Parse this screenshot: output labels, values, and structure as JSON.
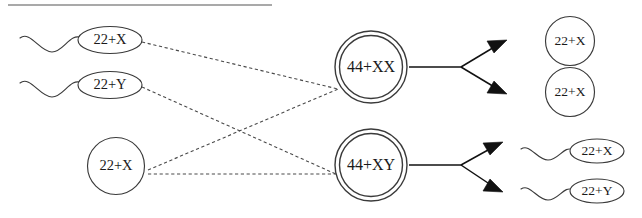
{
  "figure": {
    "title_rule": "horizontal-divider",
    "background_color": "#ffffff",
    "ink_color": "#3a3a3a",
    "width": 642,
    "height": 218
  },
  "gametes": {
    "sperm": [
      {
        "id": "sperm-1",
        "label": "22+X",
        "shape": "ellipse-with-flagellum"
      },
      {
        "id": "sperm-2",
        "label": "22+Y",
        "shape": "ellipse-with-flagellum"
      }
    ],
    "egg": [
      {
        "id": "egg-1",
        "label": "22+X",
        "shape": "circle"
      }
    ]
  },
  "zygotes": [
    {
      "id": "zygote-xx",
      "label": "44+XX",
      "shape": "double-circle"
    },
    {
      "id": "zygote-xy",
      "label": "44+XY",
      "shape": "double-circle"
    }
  ],
  "offspring": {
    "from_xx": [
      {
        "id": "offspring-xx-1",
        "label": "22+X",
        "shape": "circle"
      },
      {
        "id": "offspring-xx-2",
        "label": "22+X",
        "shape": "circle"
      }
    ],
    "from_xy": [
      {
        "id": "offspring-xy-1",
        "label": "22+X",
        "shape": "ellipse-with-flagellum"
      },
      {
        "id": "offspring-xy-2",
        "label": "22+Y",
        "shape": "ellipse-with-flagellum"
      }
    ]
  },
  "links": {
    "fertilization": [
      {
        "from": "sperm-1",
        "to": "zygote-xx",
        "style": "dashed"
      },
      {
        "from": "sperm-2",
        "to": "zygote-xy",
        "style": "dashed"
      },
      {
        "from": "egg-1",
        "to": "zygote-xx",
        "style": "dashed"
      },
      {
        "from": "egg-1",
        "to": "zygote-xy",
        "style": "dashed"
      }
    ],
    "meiosis": [
      {
        "from": "zygote-xx",
        "to": "offspring-xx-1",
        "style": "arrow"
      },
      {
        "from": "zygote-xx",
        "to": "offspring-xx-2",
        "style": "arrow"
      },
      {
        "from": "zygote-xy",
        "to": "offspring-xy-1",
        "style": "arrow"
      },
      {
        "from": "zygote-xy",
        "to": "offspring-xy-2",
        "style": "arrow"
      }
    ]
  }
}
